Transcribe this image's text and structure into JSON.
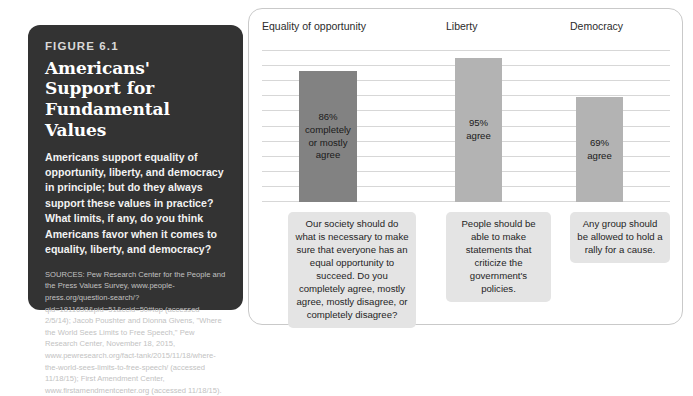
{
  "figure": {
    "eyebrow": "FIGURE 6.1",
    "title": "Americans' Support for Fundamental Values",
    "description": "Americans support equality of opportunity, liberty, and democracy in principle; but do they always support these values in practice? What limits, if any, do you think Americans favor when it comes to equality, liberty, and democracy?",
    "sources": "SOURCES: Pew Research Center for the People and the Press Values Survey, www.people-press.org/question-search/?qid=1811658&pid=51&ccid=50#top (accessed 2/5/14); Jacob Poushter and Dionna Givens, \"Where the World Sees Limits to Free Speech,\" Pew Research Center, November 18, 2015, www.pewresearch.org/fact-tank/2015/11/18/where-the-world-sees-limits-to-free-speech/ (accessed 11/18/15); First Amendment Center, www.firstamendmentcenter.org (accessed 11/18/15)."
  },
  "chart_data": {
    "type": "bar",
    "title": "Americans' Support for Fundamental Values",
    "xlabel": "",
    "ylabel": "",
    "ylim": [
      0,
      100
    ],
    "grid": true,
    "legend": "none",
    "categories": [
      "Equality of opportunity",
      "Liberty",
      "Democracy"
    ],
    "values": [
      86,
      95,
      69
    ],
    "bar_labels": [
      "86%\ncompletely\nor mostly\nagree",
      "95%\nagree",
      "69%\nagree"
    ],
    "bar_colors": [
      "#828282",
      "#b3b3b3",
      "#b3b3b3"
    ],
    "questions": [
      "Our society should do what is necessary to make sure that everyone has an equal opportunity to succeed. Do you completely agree, mostly agree, mostly disagree, or completely disagree?",
      "People should be able to make statements that criticize the government's policies.",
      "Any group should be allowed to hold a rally for a cause."
    ]
  },
  "columns": [
    {
      "header": "Equality of opportunity",
      "value": 86,
      "bar_label_lines": [
        "86%",
        "completely",
        "or mostly",
        "agree"
      ],
      "question": "Our society should do what is necessary to make sure that everyone has an equal opportunity to succeed. Do you completely agree, mostly agree, mostly disagree, or completely disagree?"
    },
    {
      "header": "Liberty",
      "value": 95,
      "bar_label_lines": [
        "95%",
        "agree"
      ],
      "question": "People should be able to make statements that criticize the government's policies."
    },
    {
      "header": "Democracy",
      "value": 69,
      "bar_label_lines": [
        "69%",
        "agree"
      ],
      "question": "Any group should be allowed to hold a rally for a cause."
    }
  ],
  "colors": {
    "panel_background": "#333333",
    "card_border": "#c9c9c9",
    "gridline": "#d7d7d7",
    "question_box": "#e4e4e4",
    "bar_dark": "#828282",
    "bar_light": "#b3b3b3"
  }
}
